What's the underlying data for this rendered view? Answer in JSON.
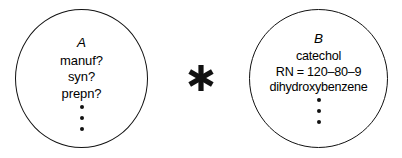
{
  "diagram": {
    "type": "two-circle-relation",
    "background_color": "#ffffff",
    "stroke_color": "#111111",
    "nodes": [
      {
        "id": "A",
        "label": "A",
        "terms": [
          "manuf?",
          "syn?",
          "prepn?"
        ],
        "ellipsis_dots": 3
      },
      {
        "id": "B",
        "label": "B",
        "terms": [
          "catechol",
          "RN = 120–80–9",
          "dihydroxybenzene"
        ],
        "ellipsis_dots": 3
      }
    ],
    "connector": {
      "glyph": "asterisk",
      "symbol": "✱",
      "points": 6
    }
  }
}
